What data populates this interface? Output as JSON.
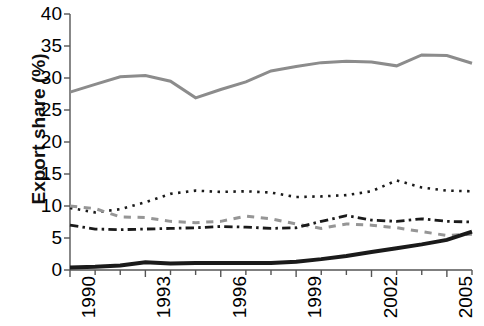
{
  "chart_data": {
    "type": "line",
    "title": "",
    "xlabel": "",
    "ylabel": "Export share (%)",
    "xlim": [
      1990,
      2006
    ],
    "ylim": [
      0,
      40
    ],
    "grid": false,
    "legend": "none",
    "x": [
      1990,
      1991,
      1992,
      1993,
      1994,
      1995,
      1996,
      1997,
      1998,
      1999,
      2000,
      2001,
      2002,
      2003,
      2004,
      2005,
      2006
    ],
    "xticks": [
      "1990",
      "1993",
      "1996",
      "1999",
      "2002",
      "2005"
    ],
    "xtick_values": [
      1990,
      1993,
      1996,
      1999,
      2002,
      2005
    ],
    "yticks": [
      "0",
      "5",
      "10",
      "15",
      "20",
      "25",
      "30",
      "35",
      "40"
    ],
    "ytick_values": [
      0,
      5,
      10,
      15,
      20,
      25,
      30,
      35,
      40
    ],
    "series": [
      {
        "name": "series-grey-solid",
        "style": "solid",
        "color": "#8c8c8c",
        "width": 3,
        "values": [
          27.8,
          29.0,
          30.2,
          30.4,
          29.5,
          26.9,
          28.2,
          29.4,
          31.1,
          31.8,
          32.4,
          32.6,
          32.5,
          31.9,
          33.6,
          33.5,
          32.3
        ]
      },
      {
        "name": "series-black-dotted",
        "style": "dotted",
        "color": "#1a1a1a",
        "width": 2.6,
        "values": [
          9.7,
          9.0,
          9.5,
          10.6,
          11.9,
          12.4,
          12.2,
          12.3,
          12.1,
          11.4,
          11.5,
          11.7,
          12.3,
          14.0,
          12.9,
          12.4,
          12.3
        ]
      },
      {
        "name": "series-grey-dashed",
        "style": "dashed",
        "color": "#969696",
        "width": 3,
        "values": [
          10.0,
          9.6,
          8.3,
          8.2,
          7.6,
          7.4,
          7.6,
          8.4,
          8.0,
          7.2,
          6.5,
          7.2,
          7.0,
          6.6,
          6.0,
          5.4,
          5.6
        ]
      },
      {
        "name": "series-black-dashdot",
        "style": "dashdot",
        "color": "#1a1a1a",
        "width": 2.8,
        "values": [
          7.0,
          6.4,
          6.3,
          6.4,
          6.5,
          6.6,
          6.8,
          6.7,
          6.5,
          6.6,
          7.6,
          8.5,
          7.8,
          7.6,
          8.0,
          7.6,
          7.5
        ]
      },
      {
        "name": "series-black-solid",
        "style": "solid",
        "color": "#1a1a1a",
        "width": 4,
        "values": [
          0.4,
          0.5,
          0.7,
          1.2,
          1.0,
          1.1,
          1.1,
          1.1,
          1.1,
          1.3,
          1.7,
          2.2,
          2.8,
          3.4,
          4.0,
          4.7,
          6.0
        ]
      }
    ]
  },
  "axes": {
    "y_title": "Export share (%)"
  }
}
